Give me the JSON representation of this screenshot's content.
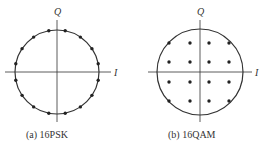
{
  "panels": [
    {
      "id": "a",
      "caption": "(a) 16PSK",
      "axis_x_label": "I",
      "axis_y_label": "Q",
      "center": [
        57,
        72
      ],
      "radius": 42,
      "points_count": 16
    },
    {
      "id": "b",
      "caption": "(b) 16QAM",
      "axis_x_label": "I",
      "axis_y_label": "Q",
      "center": [
        200,
        72
      ],
      "radius": 43,
      "grid_x": [
        169,
        190,
        209,
        229
      ],
      "grid_y": [
        43,
        62,
        82,
        101
      ]
    }
  ],
  "colors": {
    "stroke": "#333333",
    "dot": "#222222"
  }
}
